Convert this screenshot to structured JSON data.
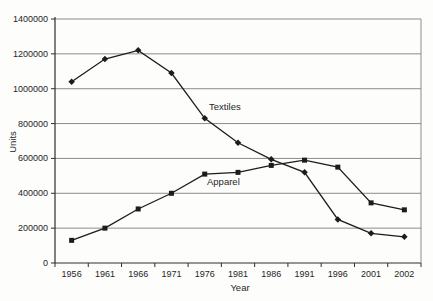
{
  "chart_data": {
    "type": "line",
    "title": "",
    "xlabel": "Year",
    "ylabel": "Units",
    "categories": [
      "1956",
      "1961",
      "1966",
      "1971",
      "1976",
      "1981",
      "1986",
      "1991",
      "1996",
      "2001",
      "2002"
    ],
    "series": [
      {
        "name": "Textiles",
        "marker": "diamond",
        "values": [
          1040000,
          1170000,
          1220000,
          1090000,
          830000,
          690000,
          595000,
          520000,
          250000,
          170000,
          150000
        ]
      },
      {
        "name": "Apparel",
        "marker": "square",
        "values": [
          130000,
          200000,
          310000,
          400000,
          510000,
          520000,
          560000,
          590000,
          550000,
          345000,
          305000
        ]
      }
    ],
    "ylim": [
      0,
      1400000
    ],
    "ytick_step": 200000,
    "grid": true,
    "legend_position": "none",
    "annotations": [
      {
        "text": "Textiles",
        "x": 209,
        "y": 110
      },
      {
        "text": "Apparel",
        "x": 207,
        "y": 185
      }
    ],
    "layout": {
      "left": 55,
      "right": 421,
      "top": 19,
      "bottom": 263
    },
    "ylabel_pos": {
      "x": 16,
      "y": 142
    },
    "xlabel_pos": {
      "x": 240,
      "y": 291
    },
    "colors": {
      "line": "#1c1c1c",
      "grid": "#8c8c8c",
      "axis": "#2e2e2e",
      "text": "#262626",
      "background": "#fdfdfc"
    }
  }
}
